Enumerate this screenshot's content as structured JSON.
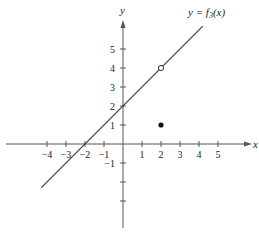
{
  "chart_data": {
    "type": "line",
    "title": "",
    "xlabel": "x",
    "ylabel": "y",
    "xlim": [
      -6,
      6.5
    ],
    "ylim": [
      -5,
      6.5
    ],
    "grid": false,
    "x_ticks": [
      -4,
      -3,
      -2,
      -1,
      1,
      2,
      3,
      4,
      5
    ],
    "x_tick_labels": [
      "−4",
      "−3",
      "−2",
      "−1",
      "1",
      "2",
      "3",
      "4",
      "5"
    ],
    "y_ticks": [
      5,
      4,
      3,
      2,
      1,
      -1,
      -2,
      -3
    ],
    "y_tick_labels": [
      "5",
      "4",
      "3",
      "2",
      "1",
      "−1",
      "",
      ""
    ],
    "series": [
      {
        "name": "y = f3(x)",
        "label": "y = f",
        "label_subscript": "3",
        "label_suffix": "(x)",
        "equation": "y = x + 2",
        "x": [
          -4.3,
          4.2
        ],
        "values": [
          -2.3,
          6.2
        ]
      }
    ],
    "points": [
      {
        "x": 2,
        "y": 4,
        "style": "open",
        "note": "hole"
      },
      {
        "x": 2,
        "y": 1,
        "style": "filled",
        "note": "f3(2) = 1"
      }
    ]
  }
}
